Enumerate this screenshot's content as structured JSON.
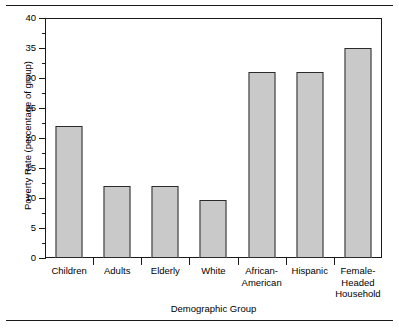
{
  "figure": {
    "rules": [
      "top-rule",
      "bottom-rule"
    ]
  },
  "chart_data": {
    "type": "bar",
    "title": "",
    "xlabel": "Demographic Group",
    "ylabel": "Poverty Rate (percentage of group)",
    "categories": [
      "Children",
      "Adults",
      "Elderly",
      "White",
      "African-\nAmerican",
      "Hispanic",
      "Female-\nHeaded\nHousehold"
    ],
    "values": [
      22,
      12,
      12,
      9.7,
      31,
      31,
      35
    ],
    "ylim": [
      0,
      40
    ],
    "yticks": [
      0,
      5,
      10,
      15,
      20,
      25,
      30,
      35,
      40
    ],
    "ytick_labels": [
      "0",
      "5",
      "10",
      "15",
      "20",
      "25",
      "30",
      "35",
      "40"
    ],
    "minor_yticks": [
      2.5,
      7.5,
      12.5,
      17.5,
      22.5,
      27.5,
      32.5,
      37.5
    ],
    "grid": false,
    "legend": null,
    "bar_color": "#c9c9c9",
    "bar_edge_color": "#2b2b2b",
    "axis_color": "#1a1a1a"
  }
}
